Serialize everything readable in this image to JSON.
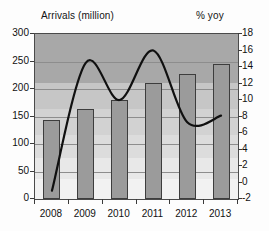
{
  "chart_data": {
    "type": "bar",
    "title": "",
    "categories": [
      "2008",
      "2009",
      "2010",
      "2011",
      "2012",
      "2013"
    ],
    "series": [
      {
        "name": "Arrivals (million)",
        "type": "bar",
        "axis": "left",
        "values": [
          144,
          164,
          180,
          211,
          227,
          245
        ]
      },
      {
        "name": "% yoy",
        "type": "line",
        "axis": "right",
        "values": [
          -1.0,
          14.5,
          10.0,
          16.0,
          7.3,
          8.1
        ]
      }
    ],
    "xlabel": "",
    "ylabel": "Arrivals (million)",
    "y2label": "% yoy",
    "ylim": [
      0,
      300
    ],
    "y2lim": [
      -2,
      18
    ],
    "yticks": [
      "300",
      "250",
      "200",
      "150",
      "100",
      "50",
      "0"
    ],
    "y2ticks": [
      "18",
      "16",
      "14",
      "12",
      "10",
      "8",
      "6",
      "4",
      "2",
      "0",
      "-2"
    ],
    "grid": true,
    "legend": "none"
  },
  "labels": {
    "left_axis_title": "Arrivals (million)",
    "right_axis_title": "% yoy"
  },
  "colors": {
    "bar_fill": "#9b9b9b",
    "bar_stroke": "#3d3d3d",
    "line": "#101010",
    "plot_bg_top": "#a8a8a8",
    "plot_bg_bottom": "#f2f2f2",
    "axis": "#4a4a4a"
  }
}
